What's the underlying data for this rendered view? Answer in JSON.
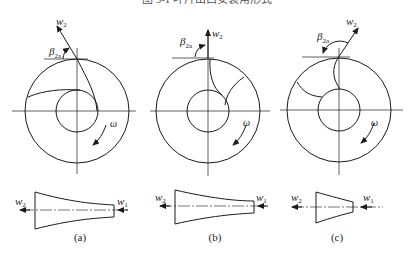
{
  "figure": {
    "top_caption_partial": "图 5-1 叶片出口安装角形式",
    "panels": [
      {
        "id": "a",
        "caption": "(a)",
        "blade_type": "backward-curved",
        "labels": {
          "w2": "w",
          "w2_sub": "2",
          "beta": "β",
          "beta_sub": "2a",
          "omega": "ω",
          "w1": "w",
          "w1_sub": "1"
        }
      },
      {
        "id": "b",
        "caption": "(b)",
        "blade_type": "radial",
        "labels": {
          "w2": "w",
          "w2_sub": "2",
          "beta": "β",
          "beta_sub": "2a",
          "omega": "ω",
          "w1": "w",
          "w1_sub": "1"
        }
      },
      {
        "id": "c",
        "caption": "(c)",
        "blade_type": "forward-curved",
        "labels": {
          "w2": "w",
          "w2_sub": "2",
          "beta": "β",
          "beta_sub": "2a",
          "omega": "ω",
          "w1": "w",
          "w1_sub": "1"
        }
      }
    ]
  }
}
